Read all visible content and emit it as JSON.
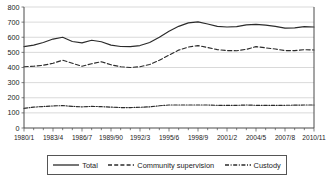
{
  "chart_data": {
    "type": "line",
    "title": "",
    "xlabel": "",
    "ylabel": "",
    "ylim": [
      0,
      800
    ],
    "ytick_step": 100,
    "yticks": [
      0,
      100,
      200,
      300,
      400,
      500,
      600,
      700,
      800
    ],
    "grid": true,
    "legend_position": "bottom",
    "x": [
      "1980/1",
      "1981/2",
      "1982/3",
      "1983/4",
      "1984/5",
      "1985/6",
      "1986/7",
      "1987/8",
      "1988/9",
      "1989/90",
      "1990/1",
      "1991/2",
      "1992/3",
      "1993/4",
      "1994/5",
      "1995/6",
      "1996/7",
      "1997/8",
      "1998/9",
      "1999/00",
      "2000/1",
      "2001/2",
      "2002/3",
      "2003/4",
      "2004/5",
      "2005/6",
      "2006/7",
      "2007/8",
      "2008/9",
      "2009/10",
      "2010/11"
    ],
    "xtick_labels": [
      "1980/1",
      "1983/4",
      "1986/7",
      "1989/90",
      "1992/3",
      "1995/6",
      "1998/9",
      "2001/2",
      "2004/5",
      "2007/8",
      "2010/11"
    ],
    "xtick_every": 3,
    "series": [
      {
        "name": "Total",
        "style": "solid",
        "values": [
          538,
          548,
          565,
          588,
          600,
          572,
          563,
          580,
          570,
          548,
          539,
          538,
          545,
          565,
          600,
          640,
          672,
          695,
          702,
          688,
          672,
          668,
          670,
          682,
          685,
          680,
          672,
          660,
          662,
          670,
          668
        ]
      },
      {
        "name": "Community supervision",
        "style": "dashed",
        "values": [
          405,
          408,
          415,
          428,
          448,
          428,
          408,
          425,
          438,
          418,
          405,
          400,
          405,
          420,
          448,
          482,
          515,
          535,
          545,
          532,
          518,
          512,
          511,
          520,
          538,
          530,
          522,
          512,
          512,
          518,
          516
        ]
      },
      {
        "name": "Custody",
        "style": "dashdot",
        "values": [
          130,
          138,
          142,
          146,
          148,
          143,
          140,
          143,
          141,
          138,
          135,
          135,
          137,
          140,
          147,
          152,
          152,
          152,
          152,
          152,
          150,
          150,
          150,
          152,
          150,
          150,
          150,
          150,
          151,
          152,
          152
        ]
      }
    ],
    "series_tail": [
      {
        "name": "Total",
        "values": [
          668,
          672,
          670,
          662,
          648,
          618,
          615,
          617,
          618,
          620,
          625
        ]
      }
    ]
  },
  "legend": {
    "entries": [
      {
        "label": "Total",
        "style": "solid",
        "icon": "solid-line-swatch"
      },
      {
        "label": "Community supervision",
        "style": "dashed",
        "icon": "dashed-line-swatch"
      },
      {
        "label": "Custody",
        "style": "dashdot",
        "icon": "dashdot-line-swatch"
      }
    ]
  }
}
